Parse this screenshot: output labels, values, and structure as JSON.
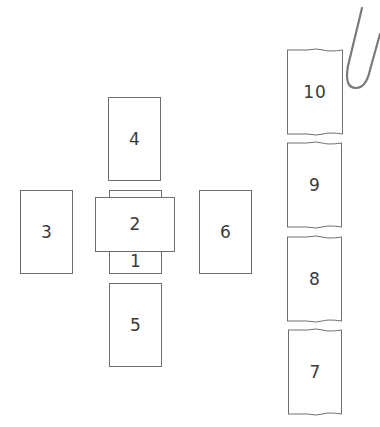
{
  "diagram": {
    "type": "tarot-spread-layout",
    "cards": [
      {
        "id": "1",
        "label": "1",
        "x": 109,
        "y": 190,
        "w": 53,
        "h": 84,
        "orientation": "vertical"
      },
      {
        "id": "2",
        "label": "2",
        "x": 95,
        "y": 197,
        "w": 80,
        "h": 55,
        "orientation": "horizontal"
      },
      {
        "id": "3",
        "label": "3",
        "x": 20,
        "y": 190,
        "w": 53,
        "h": 84,
        "orientation": "vertical"
      },
      {
        "id": "4",
        "label": "4",
        "x": 108,
        "y": 97,
        "w": 53,
        "h": 84,
        "orientation": "vertical"
      },
      {
        "id": "5",
        "label": "5",
        "x": 109,
        "y": 283,
        "w": 53,
        "h": 84,
        "orientation": "vertical"
      },
      {
        "id": "6",
        "label": "6",
        "x": 199,
        "y": 190,
        "w": 53,
        "h": 84,
        "orientation": "vertical"
      },
      {
        "id": "7",
        "label": "7",
        "x": 288,
        "y": 330,
        "w": 54,
        "h": 84,
        "orientation": "vertical",
        "style": "wavy-edge"
      },
      {
        "id": "8",
        "label": "8",
        "x": 287,
        "y": 237,
        "w": 55,
        "h": 84,
        "orientation": "vertical",
        "style": "wavy-edge"
      },
      {
        "id": "9",
        "label": "9",
        "x": 287,
        "y": 143,
        "w": 55,
        "h": 84,
        "orientation": "vertical",
        "style": "wavy-edge"
      },
      {
        "id": "10",
        "label": "10",
        "x": 287,
        "y": 50,
        "w": 56,
        "h": 84,
        "orientation": "vertical",
        "style": "wavy-edge"
      }
    ],
    "decorations": [
      {
        "name": "paperclip-icon",
        "position": "top-right"
      }
    ],
    "colors": {
      "card_border": "#6e6e6e",
      "card_text": "#3a3a3a",
      "paperclip": "#7a7a7a",
      "background": "#ffffff"
    }
  }
}
